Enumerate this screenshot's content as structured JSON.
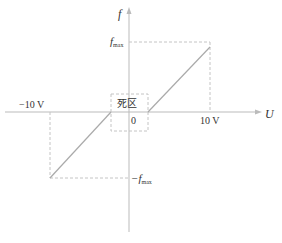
{
  "diagram": {
    "type": "dead-zone transfer characteristic",
    "axes": {
      "x_label": "U",
      "y_label": "f",
      "origin_label": "0"
    },
    "ticks": {
      "x_positive": "10 V",
      "x_negative": "−10 V",
      "y_positive_main": "f",
      "y_positive_sub": "max",
      "y_negative_prefix": "−f",
      "y_negative_sub": "max"
    },
    "dead_zone_label": "死区",
    "colors": {
      "axis": "#bbbbbb",
      "curve": "#aaaaaa",
      "dashed": "#c4c4c4",
      "text": "#333333"
    }
  }
}
